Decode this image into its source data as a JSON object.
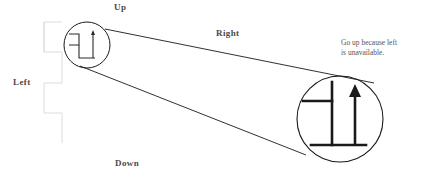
{
  "figure": {
    "kind": "magnified-path-diagram",
    "background_color": "#ffffff",
    "stroke_color": "#1a1a1a",
    "faint_stroke_color": "#d8d8d8",
    "text_color": "#4a4a4a",
    "note_color": "#555555"
  },
  "labels": {
    "up": "Up",
    "right": "Right",
    "left": "Left",
    "down": "Down"
  },
  "annotation": {
    "line1": "Go up because left",
    "line2": "is unavailable.",
    "full_text": "Go up because left is unavailable."
  },
  "icons": {
    "up_arrow": "arrow-up-icon",
    "magnifier_small": "magnifier-source-circle-icon",
    "magnifier_large": "magnifier-zoom-circle-icon",
    "step_path": "step-path-icon"
  },
  "geometry": {
    "small_circle": {
      "cx": 87,
      "cy": 45,
      "r": 23
    },
    "large_circle": {
      "cx": 340,
      "cy": 119,
      "r": 43
    },
    "cone_upper": {
      "x1": 105,
      "y1": 29,
      "x2": 374,
      "y2": 83
    },
    "cone_lower": {
      "x1": 82,
      "y1": 68,
      "x2": 307,
      "y2": 156
    },
    "faint_bracket": {
      "top": 22,
      "bottom": 143,
      "x_outer": 44,
      "x_inner": 62
    }
  }
}
